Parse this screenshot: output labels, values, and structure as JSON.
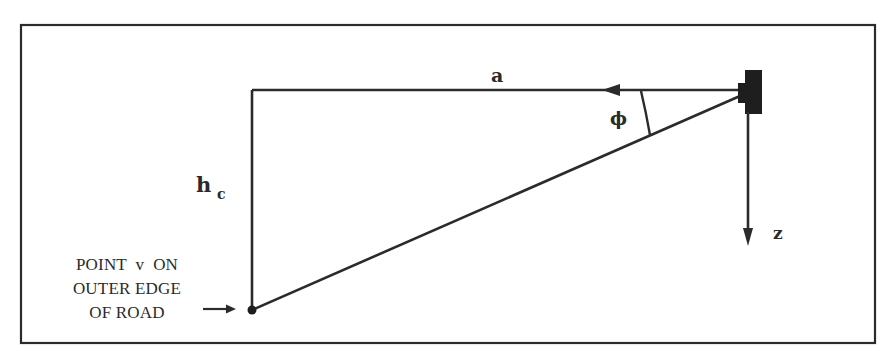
{
  "diagram": {
    "labels": {
      "horizontal_distance": "a",
      "angle": "ϕ",
      "height_symbol": "h",
      "height_subscript": "c",
      "vertical_axis": "z",
      "point_caption_line1": "POINT  v  ON",
      "point_caption_line2": "OUTER EDGE",
      "point_caption_line3": "OF ROAD"
    },
    "colors": {
      "line": "#2b2b2b",
      "background": "#ffffff",
      "sensor": "#1e1e1e"
    }
  }
}
